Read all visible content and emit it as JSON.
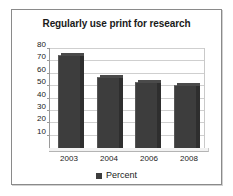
{
  "chart_data": {
    "type": "bar",
    "title": "Regularly use print for research",
    "xlabel": "",
    "ylabel": "",
    "categories": [
      "2003",
      "2004",
      "2006",
      "2008"
    ],
    "series": [
      {
        "name": "Percent",
        "values": [
          75,
          57,
          53,
          51
        ]
      }
    ],
    "ylim": [
      0,
      80
    ],
    "yticks": [
      10,
      20,
      30,
      40,
      50,
      60,
      70,
      80
    ],
    "ytick_labels": [
      "10",
      "20",
      "30",
      "40",
      "50",
      "60",
      "70",
      "80"
    ],
    "grid": true,
    "legend": {
      "position": "bottom",
      "entries": [
        {
          "label": "Percent",
          "color": "#3d3d3d"
        }
      ]
    },
    "colors": {
      "bar": "#3d3d3d",
      "bar_side": "#2e2e2e",
      "gridline": "#cfcfcf",
      "axis": "#9a9a9a",
      "frame": "#8a8a8a",
      "background": "#ffffff",
      "text": "#1a1a1a"
    }
  }
}
